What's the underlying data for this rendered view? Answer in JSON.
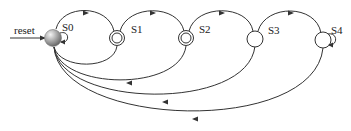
{
  "diagram": {
    "type": "state-machine",
    "reset_label": "reset",
    "states": [
      {
        "id": "S0",
        "label": "S0",
        "kind": "initial",
        "self_loop": true
      },
      {
        "id": "S1",
        "label": "S1",
        "kind": "accepting",
        "self_loop": false
      },
      {
        "id": "S2",
        "label": "S2",
        "kind": "accepting",
        "self_loop": false
      },
      {
        "id": "S3",
        "label": "S3",
        "kind": "normal",
        "self_loop": false
      },
      {
        "id": "S4",
        "label": "S4",
        "kind": "normal",
        "self_loop": true
      }
    ],
    "transitions": [
      {
        "from": "reset",
        "to": "S0"
      },
      {
        "from": "S0",
        "to": "S0"
      },
      {
        "from": "S0",
        "to": "S1"
      },
      {
        "from": "S1",
        "to": "S2"
      },
      {
        "from": "S2",
        "to": "S3"
      },
      {
        "from": "S3",
        "to": "S4"
      },
      {
        "from": "S4",
        "to": "S4"
      },
      {
        "from": "S1",
        "to": "S0"
      },
      {
        "from": "S2",
        "to": "S0"
      },
      {
        "from": "S3",
        "to": "S0"
      },
      {
        "from": "S4",
        "to": "S0"
      }
    ],
    "colors": {
      "line": "#333333",
      "s0_fill": "#9a9a9a"
    }
  }
}
